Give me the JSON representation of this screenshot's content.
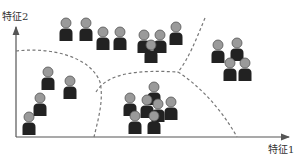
{
  "figure": {
    "type": "clustering-diagram",
    "axes": {
      "x_label": "特征1",
      "y_label": "特征2"
    },
    "colors": {
      "axis": "#555555",
      "boundary": "#777777",
      "person_head": "#9a9a9a",
      "person_body": "#222222"
    },
    "clusters": [
      {
        "name": "top",
        "people": [
          [
            66,
            23
          ],
          [
            86,
            23
          ],
          [
            103,
            32
          ],
          [
            120,
            32
          ],
          [
            144,
            35
          ],
          [
            160,
            35
          ],
          [
            151,
            45
          ],
          [
            176,
            27
          ]
        ]
      },
      {
        "name": "right",
        "people": [
          [
            218,
            45
          ],
          [
            237,
            43
          ],
          [
            230,
            63
          ],
          [
            245,
            63
          ]
        ]
      },
      {
        "name": "left",
        "people": [
          [
            48,
            72
          ],
          [
            70,
            81
          ],
          [
            40,
            98
          ],
          [
            29,
            117
          ]
        ]
      },
      {
        "name": "bottom-middle",
        "people": [
          [
            154,
            87
          ],
          [
            130,
            98
          ],
          [
            147,
            100
          ],
          [
            158,
            104
          ],
          [
            171,
            102
          ],
          [
            135,
            116
          ],
          [
            154,
            116
          ]
        ]
      }
    ],
    "boundaries": [
      "M16,51 C50,47 90,56 100,82 C104,100 98,120 94,137",
      "M96,92 C108,72 140,70 178,72",
      "M205,18 C196,40 188,60 178,72 C200,86 222,110 237,137"
    ]
  }
}
